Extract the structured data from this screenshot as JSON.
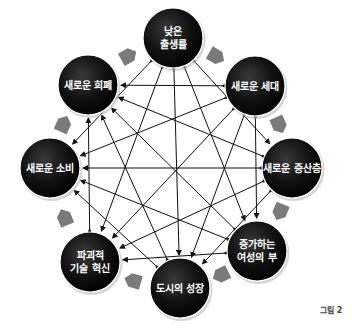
{
  "diagram": {
    "nodes": [
      {
        "id": "low-birthrate",
        "lines": [
          "낮은",
          "출생률"
        ],
        "cx": 173,
        "cy": 38
      },
      {
        "id": "new-generation",
        "lines": [
          "새로운 세대"
        ],
        "cx": 255,
        "cy": 86
      },
      {
        "id": "new-middle-class",
        "lines": [
          "새로운 중산층"
        ],
        "cx": 292,
        "cy": 168
      },
      {
        "id": "rising-female-wealth",
        "lines": [
          "증가하는",
          "여성의 부"
        ],
        "cx": 257,
        "cy": 251
      },
      {
        "id": "urban-growth",
        "lines": [
          "도시의 성장"
        ],
        "cx": 180,
        "cy": 288
      },
      {
        "id": "disruptive-tech",
        "lines": [
          "파괴적",
          "기술 혁신"
        ],
        "cx": 90,
        "cy": 262
      },
      {
        "id": "new-consumption",
        "lines": [
          "새로운 소비"
        ],
        "cx": 50,
        "cy": 168
      },
      {
        "id": "new-currency",
        "lines": [
          "새로운 회폐"
        ],
        "cx": 88,
        "cy": 85
      }
    ],
    "node_radius": 30,
    "colors": {
      "node_fill": "#111111",
      "ring_arrow": "#7a7a7a",
      "line": "#111111"
    },
    "figure_label": "그림 2"
  }
}
